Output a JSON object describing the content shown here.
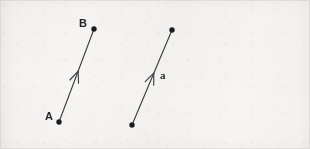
{
  "figure": {
    "background_color": "#f6f5f3",
    "ink_color": "#333333",
    "border_color": "#e6e4e1",
    "width": 310,
    "height": 149
  },
  "vectors": [
    {
      "id": "vector-AB",
      "name": "AB",
      "tail": {
        "label": "A",
        "x": 59,
        "y": 122
      },
      "head": {
        "label": "B",
        "x": 94,
        "y": 29
      },
      "arrow_at": "midpoint",
      "tail_label_offset": {
        "x": -14,
        "y": -5
      },
      "head_label_offset": {
        "x": -15,
        "y": -12
      }
    },
    {
      "id": "vector-a",
      "name": "a",
      "tail": {
        "label": "",
        "x": 132,
        "y": 125
      },
      "head": {
        "label": "",
        "x": 172,
        "y": 30
      },
      "arrow_at": "midpoint",
      "vector_label": "a",
      "vector_label_pos": {
        "x": 160,
        "y": 74
      }
    }
  ],
  "labels": {
    "point_a": "A",
    "point_b": "B",
    "vector_a": "a"
  }
}
